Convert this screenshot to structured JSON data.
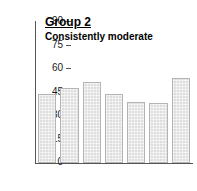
{
  "chart_data": {
    "type": "bar",
    "title": "Group 2",
    "subtitle": "Consistently moderate",
    "xlabel": "",
    "ylabel": "",
    "categories": [
      "5",
      "8",
      "11",
      "13",
      "15",
      "17",
      "19"
    ],
    "values": [
      44,
      48,
      52,
      44,
      39,
      38,
      54
    ],
    "ylim": [
      0,
      90
    ],
    "yticks": [
      0,
      15,
      30,
      45,
      60,
      75,
      90
    ],
    "ytick_labels": [
      "0",
      "15",
      "30",
      "45",
      "60",
      "75",
      "90"
    ],
    "grid": false,
    "legend": null,
    "bar_fill_color": "#dedede",
    "bar_border_color": "#b4b4b4",
    "axis_color": "#555555",
    "text_color": "#1a1a1a",
    "background_color": "#ffffff"
  }
}
